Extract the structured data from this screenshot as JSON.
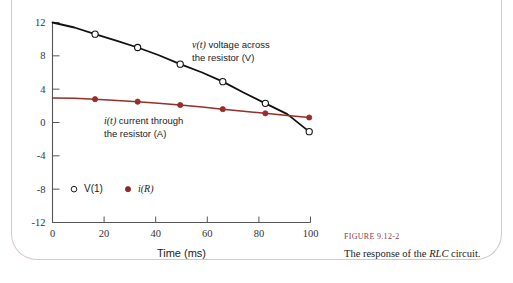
{
  "figure": {
    "caption_label": "FIGURE",
    "caption_number": "9.12-2",
    "caption_text_before": "The response of the ",
    "caption_text_italic": "RLC",
    "caption_text_after": " circuit."
  },
  "annotations": {
    "voltage": {
      "italic_symbol": "v(t)",
      "line1_rest": " voltage across",
      "line2": "the resistor (V)",
      "x": 192,
      "y": 48
    },
    "current": {
      "italic_symbol": "i(t)",
      "line1_rest": " current through",
      "line2": "the resistor (A)",
      "x": 104,
      "y": 124
    }
  },
  "legend": {
    "position": "inside-lower-left",
    "entries": [
      {
        "label": "V(1)",
        "marker": "open-circle",
        "color": "#1a1a1a",
        "italic": false
      },
      {
        "label": "i(R)",
        "marker": "filled-circle",
        "color": "#8c2a26",
        "italic": true
      }
    ]
  },
  "colors": {
    "voltage": "#111111",
    "current": "#962e2a",
    "axis": "#555555",
    "caption_accent": "#8f3b4a",
    "page_border": "#d8c8c8",
    "background": "#ffffff"
  },
  "chart_data": {
    "type": "line",
    "title": "",
    "xlabel": "Time (ms)",
    "ylabel": "",
    "xlim": [
      0,
      100
    ],
    "ylim": [
      -12,
      12
    ],
    "xticks": [
      0,
      20,
      40,
      60,
      80,
      100
    ],
    "yticks": [
      12,
      8,
      4,
      0,
      -4,
      -8,
      -12
    ],
    "xtick_labels": [
      "0",
      "20",
      "40",
      "60",
      "80",
      "100"
    ],
    "ytick_labels": [
      "12",
      "8",
      "4",
      "0",
      "-4",
      "-8",
      "-12"
    ],
    "grid": false,
    "legend_position": "lower-left-inside",
    "series": [
      {
        "name": "V(1)",
        "label": "v(t) voltage across the resistor (V)",
        "units": "V",
        "color": "#111111",
        "marker": "open-circle",
        "x": [
          0,
          8.5,
          16.5,
          25,
          33,
          41,
          49.5,
          58,
          66,
          74,
          82.5,
          91,
          99.5
        ],
        "y": [
          12.0,
          11.4,
          10.6,
          9.8,
          9.0,
          8.1,
          7.0,
          6.0,
          4.9,
          3.6,
          2.3,
          1.0,
          -1.1
        ],
        "marker_x": [
          16.5,
          33,
          49.5,
          66,
          82.5,
          99.5
        ],
        "marker_y": [
          10.6,
          9.0,
          7.0,
          4.9,
          2.3,
          -1.1
        ]
      },
      {
        "name": "i(R)",
        "label": "i(t) current through the resistor (A)",
        "units": "A",
        "color": "#962e2a",
        "marker": "filled-circle",
        "x": [
          0,
          8.5,
          16.5,
          25,
          33,
          41,
          49.5,
          58,
          66,
          74,
          82.5,
          91,
          99.5
        ],
        "y": [
          2.95,
          2.9,
          2.8,
          2.65,
          2.5,
          2.3,
          2.1,
          1.85,
          1.6,
          1.35,
          1.1,
          0.85,
          0.6
        ],
        "marker_x": [
          16.5,
          33,
          49.5,
          66,
          82.5,
          99.5
        ],
        "marker_y": [
          2.8,
          2.5,
          2.1,
          1.6,
          1.1,
          0.6
        ]
      }
    ],
    "annotations": [
      {
        "text": "v(t) voltage across the resistor (V)",
        "series": "V(1)"
      },
      {
        "text": "i(t) current through the resistor (A)",
        "series": "i(R)"
      }
    ]
  }
}
